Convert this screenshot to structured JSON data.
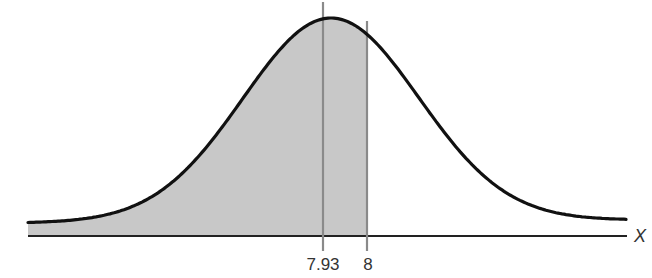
{
  "chart_data": {
    "type": "area",
    "title": "",
    "distribution": "normal",
    "mean": 7.93,
    "xlabel": "X",
    "ylabel": "",
    "tick_labels": [
      "7.93",
      "8"
    ],
    "ticks": [
      7.93,
      8
    ],
    "shaded_region": {
      "from": "-infinity",
      "to": 8
    },
    "reference_lines": [
      {
        "x": 7.93,
        "label": "7.93",
        "role": "mean"
      },
      {
        "x": 8,
        "label": "8",
        "role": "value"
      }
    ],
    "grid": false,
    "legend": null,
    "colors": {
      "curve": "#111111",
      "shade": "#c8c8c8",
      "axis": "#222222",
      "reference_line": "#8a8a8a",
      "text": "#333333"
    }
  }
}
